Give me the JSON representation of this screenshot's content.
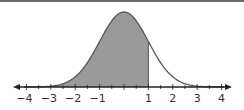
{
  "chart_data": {
    "type": "area",
    "title": "",
    "subtitle": "",
    "xlabel": "",
    "ylabel": "",
    "distribution": {
      "name": "standard normal",
      "mean": 0,
      "sd": 1
    },
    "shaded_region": {
      "from": "-inf",
      "to": 1
    },
    "xlim": [
      -4.3,
      4.3
    ],
    "x_ticks": [
      -4,
      -3,
      -2,
      -1,
      1,
      2,
      3,
      4
    ],
    "x_tick_labels": [
      "−4",
      "−3",
      "−2",
      "−1",
      "1",
      "2",
      "3",
      "4"
    ],
    "minor_tick_step": 0.5,
    "grid": false,
    "legend": null,
    "colors": {
      "shade": "#9a9a9a",
      "curve": "#555555",
      "axis": "#222222",
      "frame_top": "#6a6a6a"
    }
  }
}
